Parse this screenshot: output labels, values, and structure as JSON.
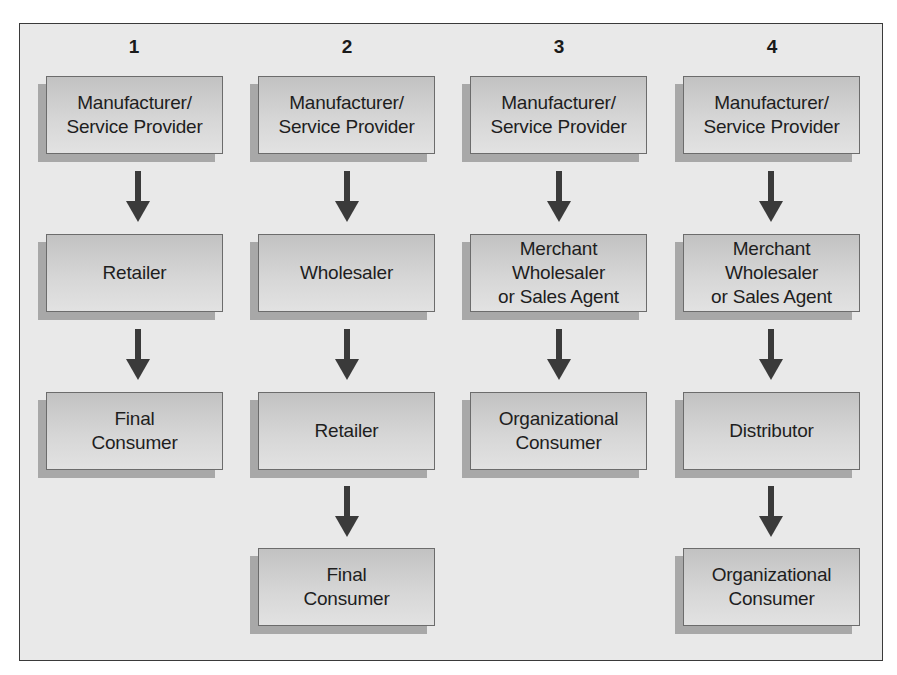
{
  "diagram": {
    "title": "",
    "colors": {
      "background": "#e9e9e9",
      "box_top": "#c2c2c2",
      "box_bottom": "#e2e2e2",
      "shadow": "#a8a8a8",
      "arrow": "#3a3a3a",
      "border": "#3a3a3a"
    },
    "columns": [
      {
        "number": "1",
        "steps": [
          "Manufacturer/\nService Provider",
          "Retailer",
          "Final\nConsumer"
        ]
      },
      {
        "number": "2",
        "steps": [
          "Manufacturer/\nService Provider",
          "Wholesaler",
          "Retailer",
          "Final\nConsumer"
        ]
      },
      {
        "number": "3",
        "steps": [
          "Manufacturer/\nService Provider",
          "Merchant\nWholesaler\nor Sales Agent",
          "Organizational\nConsumer"
        ]
      },
      {
        "number": "4",
        "steps": [
          "Manufacturer/\nService Provider",
          "Merchant\nWholesaler\nor Sales Agent",
          "Distributor",
          "Organizational\nConsumer"
        ]
      }
    ]
  }
}
